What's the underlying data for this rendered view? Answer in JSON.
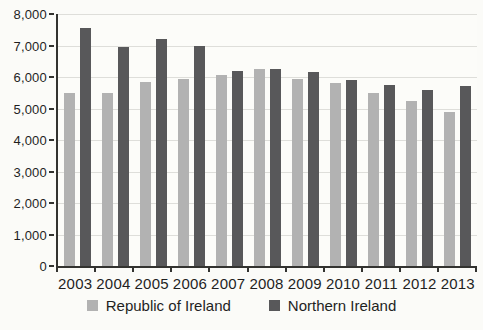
{
  "chart_data": {
    "type": "bar",
    "title": "",
    "xlabel": "",
    "ylabel": "",
    "categories": [
      "2003",
      "2004",
      "2005",
      "2006",
      "2007",
      "2008",
      "2009",
      "2010",
      "2011",
      "2012",
      "2013"
    ],
    "series": [
      {
        "name": "Republic of Ireland",
        "color": "#b2b2b2",
        "values": [
          5500,
          5500,
          5850,
          5950,
          6050,
          6250,
          5950,
          5800,
          5500,
          5250,
          4900
        ]
      },
      {
        "name": "Northern Ireland",
        "color": "#58585a",
        "values": [
          7550,
          6950,
          7200,
          7000,
          6200,
          6250,
          6150,
          5900,
          5750,
          5600,
          5700
        ]
      }
    ],
    "ylim": [
      0,
      8000
    ],
    "ytick_interval": 1000,
    "yticks": [
      0,
      1000,
      2000,
      3000,
      4000,
      5000,
      6000,
      7000,
      8000
    ],
    "ytick_labels": [
      "0",
      "1,000",
      "2,000",
      "3,000",
      "4,000",
      "5,000",
      "6,000",
      "7,000",
      "8,000"
    ],
    "grid": true,
    "legend_position": "bottom"
  },
  "colors": {
    "background": "#fbfbf8",
    "plot_background": "#fcfcf9",
    "gridline": "#dededa",
    "axis": "#333330",
    "text": "#1f1f1f"
  }
}
